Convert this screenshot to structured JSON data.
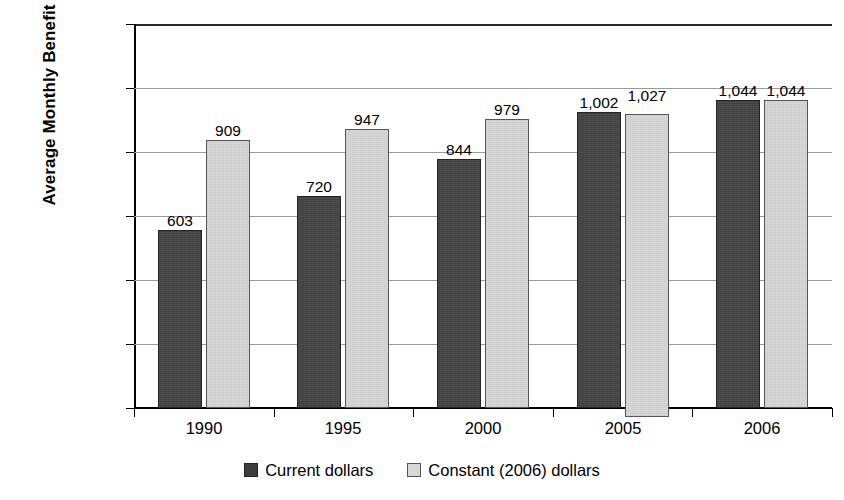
{
  "chart_data": {
    "type": "bar",
    "title": "",
    "xlabel": "",
    "ylabel": "Average Monthly Benefit",
    "ylim": [
      0,
      1200
    ],
    "ytick_labels": [
      "$0",
      "$200",
      "$400",
      "$600",
      "$800",
      "$1,000",
      "$1,200"
    ],
    "ytick_values": [
      0,
      200,
      400,
      600,
      800,
      1000,
      1200
    ],
    "grid": true,
    "legend_position": "bottom-center",
    "categories": [
      "1990",
      "1995",
      "2000",
      "2005",
      "2006"
    ],
    "series": [
      {
        "name": "Current dollars",
        "color": "#3d3d3d",
        "values": [
          603,
          720,
          844,
          1002,
          1044
        ],
        "labels": [
          "603",
          "720",
          "844",
          "1,002",
          "1,044"
        ]
      },
      {
        "name": "Constant (2006) dollars",
        "color": "#d8d8d8",
        "values": [
          909,
          947,
          979,
          1027,
          1044
        ],
        "labels": [
          "909",
          "947",
          "979",
          "1,027",
          "1,044"
        ]
      }
    ]
  },
  "axis": {
    "y_title": "Average Monthly Benefit"
  },
  "legend": {
    "items": [
      {
        "label": "Current dollars"
      },
      {
        "label": "Constant (2006) dollars"
      }
    ]
  }
}
